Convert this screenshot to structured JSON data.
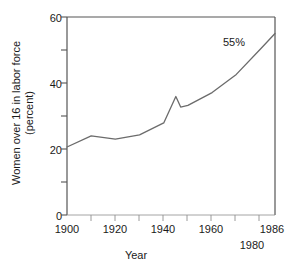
{
  "chart_data": {
    "type": "line",
    "title": "",
    "xlabel": "Year",
    "ylabel_lines": [
      "Women over 16 in labor force",
      "(percent)"
    ],
    "ylabel": "Women over 16 in labor force (percent)",
    "xlim": [
      1900,
      1986
    ],
    "ylim": [
      0,
      60
    ],
    "grid": false,
    "legend": "none",
    "x_major_ticks": [
      1900,
      1920,
      1940,
      1960,
      1986
    ],
    "x_minor_ticks": [
      1910,
      1930,
      1950,
      1970,
      1980
    ],
    "x_tick_labels": [
      {
        "value": 1900,
        "label": "1900",
        "row": 0
      },
      {
        "value": 1920,
        "label": "1920",
        "row": 0
      },
      {
        "value": 1940,
        "label": "1940",
        "row": 0
      },
      {
        "value": 1960,
        "label": "1960",
        "row": 0
      },
      {
        "value": 1986,
        "label": "1986",
        "row": 0
      },
      {
        "value": 1980,
        "label": "1980",
        "row": 1
      }
    ],
    "y_major_ticks": [
      0,
      20,
      40,
      60
    ],
    "y_minor_ticks": [
      10,
      30,
      50
    ],
    "y_tick_labels": [
      "0",
      "20",
      "40",
      "60"
    ],
    "series": [
      {
        "name": "Women over 16 in labor force",
        "color": "#6b6b6b",
        "x": [
          1900,
          1910,
          1920,
          1930,
          1940,
          1945,
          1947,
          1950,
          1960,
          1970,
          1980,
          1986
        ],
        "values": [
          20.6,
          24.0,
          23.0,
          24.3,
          27.9,
          35.9,
          32.7,
          33.2,
          37.1,
          42.6,
          50.3,
          55.0
        ]
      }
    ],
    "annotations": [
      {
        "text": "55%",
        "x": 1980,
        "y": 55.5,
        "name": "value-label-55-percent"
      }
    ]
  },
  "axes": {
    "frame_color": "#555555",
    "line_color": "#6b6b6b",
    "text_color": "#1a1a1a"
  }
}
